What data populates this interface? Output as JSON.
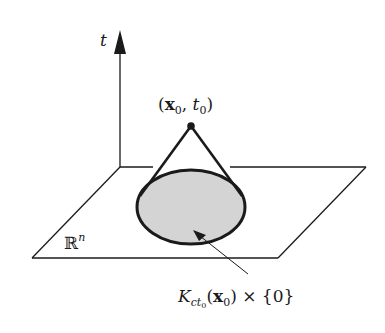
{
  "diagram": {
    "type": "backward-light-cone",
    "axis_label": "t",
    "apex_label": "(x₀, t₀)",
    "apex_label_parts": {
      "open": "(",
      "x": "x",
      "x_sub": "0",
      "sep": ", ",
      "t": "t",
      "t_sub": "0",
      "close": ")"
    },
    "plane_label": "ℝ",
    "plane_label_sup": "n",
    "base_label_parts": {
      "K": "K",
      "K_sub": "ct",
      "K_subsub": "0",
      "open": "(",
      "x": "x",
      "x_sub": "0",
      "rest": ") × {0}"
    },
    "base_label": "K_{ct₀}(x₀) × {0}",
    "colors": {
      "stroke": "#1a1a1a",
      "disk_fill": "#d4d4d4",
      "background": "#ffffff"
    }
  }
}
